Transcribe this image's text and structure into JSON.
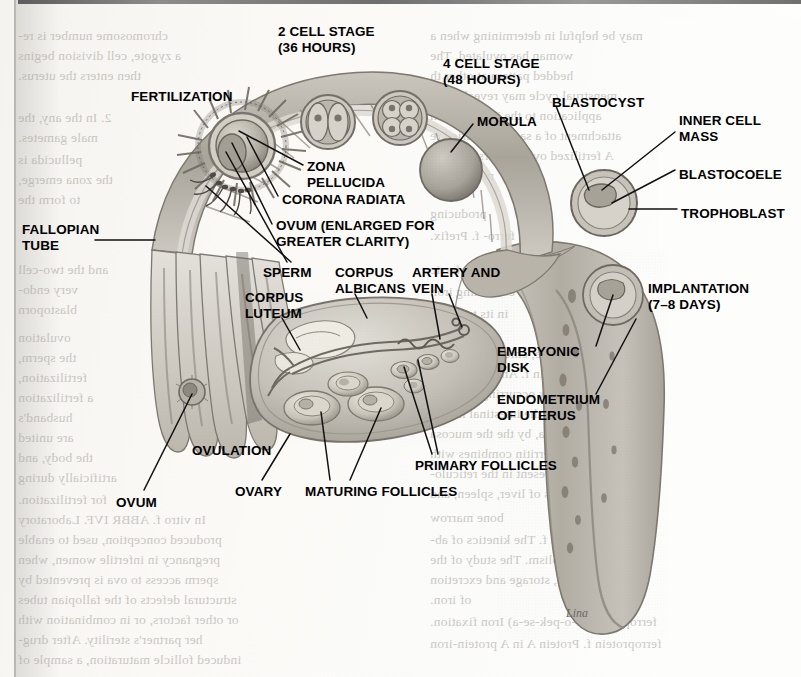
{
  "figure": {
    "signature": "Lina"
  },
  "palette": {
    "ink": "#000000",
    "paper": "#f8f7f4",
    "tissue_light": "#d9d6cf",
    "tissue_mid": "#b8b4ab",
    "tissue_dark": "#8e8a81",
    "tissue_deep": "#6e6a62",
    "ghost_text": "#9d9b95"
  },
  "labels": [
    {
      "id": "fertilization",
      "text": "FERTILIZATION",
      "x": 131,
      "y": 89,
      "align": "left"
    },
    {
      "id": "two-cell-stage",
      "text": "2 CELL STAGE\n(36 HOURS)",
      "x": 278,
      "y": 24,
      "align": "left"
    },
    {
      "id": "four-cell-stage",
      "text": "4 CELL STAGE\n(48 HOURS)",
      "x": 443,
      "y": 56,
      "align": "left"
    },
    {
      "id": "morula",
      "text": "MORULA",
      "x": 477,
      "y": 114,
      "align": "left"
    },
    {
      "id": "blastocyst",
      "text": "BLASTOCYST",
      "x": 552,
      "y": 95,
      "align": "left"
    },
    {
      "id": "inner-cell-mass",
      "text": "INNER CELL\nMASS",
      "x": 679,
      "y": 113,
      "align": "left"
    },
    {
      "id": "blastocoele",
      "text": "BLASTOCOELE",
      "x": 679,
      "y": 167,
      "align": "left"
    },
    {
      "id": "trophoblast",
      "text": "TROPHOBLAST",
      "x": 681,
      "y": 206,
      "align": "left"
    },
    {
      "id": "implantation",
      "text": "IMPLANTATION\n(7–8 DAYS)",
      "x": 648,
      "y": 281,
      "align": "left"
    },
    {
      "id": "zona-pellucida",
      "text": "ZONA\nPELLUCIDA",
      "x": 307,
      "y": 159,
      "align": "left"
    },
    {
      "id": "corona-radiata",
      "text": "CORONA RADIATA",
      "x": 282,
      "y": 192,
      "align": "left"
    },
    {
      "id": "ovum-enlarged",
      "text": "OVUM (ENLARGED FOR\nGREATER CLARITY)",
      "x": 276,
      "y": 218,
      "align": "left"
    },
    {
      "id": "sperm",
      "text": "SPERM",
      "x": 263,
      "y": 265,
      "align": "left"
    },
    {
      "id": "corpus-albicans",
      "text": "CORPUS\nALBICANS",
      "x": 335,
      "y": 265,
      "align": "left"
    },
    {
      "id": "artery-and-vein",
      "text": "ARTERY AND\nVEIN",
      "x": 412,
      "y": 265,
      "align": "left"
    },
    {
      "id": "corpus-luteum",
      "text": "CORPUS\nLUTEUM",
      "x": 245,
      "y": 290,
      "align": "left"
    },
    {
      "id": "fallopian-tube",
      "text": "FALLOPIAN\nTUBE",
      "x": 22,
      "y": 222,
      "align": "left"
    },
    {
      "id": "embryonic-disk",
      "text": "EMBRYONIC\nDISK",
      "x": 497,
      "y": 344,
      "align": "left"
    },
    {
      "id": "endometrium-of-uterus",
      "text": "ENDOMETRIUM\nOF UTERUS",
      "x": 497,
      "y": 392,
      "align": "left"
    },
    {
      "id": "primary-follicles",
      "text": "PRIMARY FOLLICLES",
      "x": 415,
      "y": 458,
      "align": "left"
    },
    {
      "id": "maturing-follicles",
      "text": "MATURING FOLLICLES",
      "x": 305,
      "y": 484,
      "align": "left"
    },
    {
      "id": "ovary",
      "text": "OVARY",
      "x": 235,
      "y": 484,
      "align": "left"
    },
    {
      "id": "ovulation",
      "text": "OVULATION",
      "x": 192,
      "y": 443,
      "align": "left"
    },
    {
      "id": "ovum",
      "text": "OVUM",
      "x": 116,
      "y": 495,
      "align": "left"
    }
  ],
  "leaders": [
    {
      "id": "fallopian-tube",
      "x1": 95,
      "y1": 240,
      "x2": 155,
      "y2": 240
    },
    {
      "id": "zona-pellucida",
      "x1": 303,
      "y1": 165,
      "x2": 239,
      "y2": 131
    },
    {
      "id": "corona-radiata",
      "x1": 278,
      "y1": 196,
      "x2": 247,
      "y2": 137
    },
    {
      "id": "ovum-enlarged",
      "x1": 272,
      "y1": 224,
      "x2": 232,
      "y2": 143
    },
    {
      "id": "sperm-a",
      "x1": 287,
      "y1": 262,
      "x2": 226,
      "y2": 152
    },
    {
      "id": "sperm-b",
      "x1": 291,
      "y1": 262,
      "x2": 206,
      "y2": 186
    },
    {
      "id": "corpus-luteum",
      "x1": 282,
      "y1": 318,
      "x2": 300,
      "y2": 350
    },
    {
      "id": "corpus-albicans",
      "x1": 355,
      "y1": 294,
      "x2": 367,
      "y2": 318
    },
    {
      "id": "artery-vein-a",
      "x1": 432,
      "y1": 294,
      "x2": 440,
      "y2": 339
    },
    {
      "id": "artery-vein-b",
      "x1": 449,
      "y1": 294,
      "x2": 462,
      "y2": 327
    },
    {
      "id": "morula",
      "x1": 473,
      "y1": 124,
      "x2": 451,
      "y2": 152
    },
    {
      "id": "blastocyst",
      "x1": 556,
      "y1": 106,
      "x2": 589,
      "y2": 190
    },
    {
      "id": "inner-cell-mass",
      "x1": 675,
      "y1": 132,
      "x2": 602,
      "y2": 190
    },
    {
      "id": "blastocoele",
      "x1": 675,
      "y1": 170,
      "x2": 612,
      "y2": 203
    },
    {
      "id": "trophoblast",
      "x1": 677,
      "y1": 209,
      "x2": 629,
      "y2": 209
    },
    {
      "id": "embryonic-disk",
      "x1": 596,
      "y1": 346,
      "x2": 613,
      "y2": 295
    },
    {
      "id": "endometrium",
      "x1": 596,
      "y1": 394,
      "x2": 636,
      "y2": 319
    },
    {
      "id": "primary-a",
      "x1": 432,
      "y1": 454,
      "x2": 404,
      "y2": 367
    },
    {
      "id": "primary-b",
      "x1": 438,
      "y1": 454,
      "x2": 418,
      "y2": 360
    },
    {
      "id": "maturing-a",
      "x1": 330,
      "y1": 480,
      "x2": 321,
      "y2": 412
    },
    {
      "id": "maturing-b",
      "x1": 350,
      "y1": 480,
      "x2": 381,
      "y2": 408
    },
    {
      "id": "ovary",
      "x1": 262,
      "y1": 480,
      "x2": 290,
      "y2": 434
    },
    {
      "id": "ovum",
      "x1": 144,
      "y1": 490,
      "x2": 192,
      "y2": 394
    }
  ],
  "ghost_text": {
    "left_column": [
      {
        "text": "chromosome number is re-",
        "x": 18,
        "y": 28
      },
      {
        "text": "a zygote, cell division begins",
        "x": 18,
        "y": 48
      },
      {
        "text": "then enters the uterus.",
        "x": 18,
        "y": 68
      },
      {
        "text": "2. In the any, the",
        "x": 18,
        "y": 110
      },
      {
        "text": "male gametes.",
        "x": 18,
        "y": 130
      },
      {
        "text": "pellucida is",
        "x": 18,
        "y": 152
      },
      {
        "text": "the zona emerge,",
        "x": 18,
        "y": 172
      },
      {
        "text": "to form the",
        "x": 18,
        "y": 192
      },
      {
        "text": "and the two-cell",
        "x": 18,
        "y": 262
      },
      {
        "text": "very endo-",
        "x": 18,
        "y": 282
      },
      {
        "text": "blastoporn",
        "x": 18,
        "y": 302
      },
      {
        "text": "ovulation",
        "x": 18,
        "y": 330
      },
      {
        "text": "the sperm,",
        "x": 18,
        "y": 350
      },
      {
        "text": "fertilization,",
        "x": 18,
        "y": 370
      },
      {
        "text": "a fertilization",
        "x": 18,
        "y": 390
      },
      {
        "text": "husband's",
        "x": 18,
        "y": 410
      },
      {
        "text": "are united",
        "x": 18,
        "y": 430
      },
      {
        "text": "the body, and",
        "x": 18,
        "y": 450
      },
      {
        "text": "artificially during",
        "x": 18,
        "y": 470
      },
      {
        "text": "for fertilization.",
        "x": 18,
        "y": 492
      },
      {
        "text": "In vitro f. ABBR IVF. Laboratory",
        "x": 18,
        "y": 512
      },
      {
        "text": "produced conception, used to enable",
        "x": 18,
        "y": 532
      },
      {
        "text": "pregnancy in infertile women, when",
        "x": 18,
        "y": 552
      },
      {
        "text": "sperm access to ova is prevented by",
        "x": 18,
        "y": 572
      },
      {
        "text": "structural defects of the fallopian tubes",
        "x": 18,
        "y": 592
      },
      {
        "text": "or other factors, or in combination with",
        "x": 18,
        "y": 612
      },
      {
        "text": "her partner's sterility. After drug-",
        "x": 18,
        "y": 632
      },
      {
        "text": "induced follicle maturation, a sample of",
        "x": 18,
        "y": 652
      }
    ],
    "right_column": [
      {
        "text": "may be helpful in determining when a",
        "x": 430,
        "y": 28
      },
      {
        "text": "woman has ovulated. The",
        "x": 430,
        "y": 48
      },
      {
        "text": "hedded pattern at other th",
        "x": 430,
        "y": 68
      },
      {
        "text": "menstrual cycle may reveal focus",
        "x": 430,
        "y": 88
      },
      {
        "text": "application to the implantation",
        "x": 430,
        "y": 108
      },
      {
        "text": "attachment of a sample of dried re",
        "x": 430,
        "y": 128
      },
      {
        "text": "A fertilized ovum enters the tube",
        "x": 430,
        "y": 148
      },
      {
        "text": "membranes",
        "x": 430,
        "y": 168
      },
      {
        "text": "producing",
        "x": 430,
        "y": 206
      },
      {
        "text": "ferri, ferro-  f. Prefix.",
        "x": 430,
        "y": 228
      },
      {
        "text": "ferric",
        "x": 430,
        "y": 262
      },
      {
        "text": "2. Ferriporphyrin, containing iron",
        "x": 430,
        "y": 284
      },
      {
        "text": "in its trivalent",
        "x": 430,
        "y": 306
      },
      {
        "text": "f. chloride",
        "x": 430,
        "y": 326
      },
      {
        "text": "tincture in medicine, chiefly astringent",
        "x": 430,
        "y": 346
      },
      {
        "text": "ferritin  f. An iron-storage",
        "x": 430,
        "y": 366
      },
      {
        "text": "protein complex occurring through-",
        "x": 430,
        "y": 386
      },
      {
        "text": "out; it is found in the intestinal muco-",
        "x": 430,
        "y": 406
      },
      {
        "text": "sa, by the the mucosa",
        "x": 430,
        "y": 426
      },
      {
        "text": "ferritin, apoferritin combines with",
        "x": 430,
        "y": 446
      },
      {
        "text": "and is normally present in the reticulo-",
        "x": 430,
        "y": 466
      },
      {
        "text": "endothelial cells of liver, spleen, and",
        "x": 430,
        "y": 486
      },
      {
        "text": "bone marrow",
        "x": 430,
        "y": 510
      },
      {
        "text": "ferrokinetics  f. The kinetics of ab- ",
        "x": 430,
        "y": 532
      },
      {
        "text": "sorption, metabolism. The study of the",
        "x": 430,
        "y": 552
      },
      {
        "text": "absorption, storage and excretion",
        "x": 430,
        "y": 572
      },
      {
        "text": "of iron.",
        "x": 430,
        "y": 592
      },
      {
        "text": "ferropexia  (fer-o-pek-se-a)  Iron fixation.",
        "x": 430,
        "y": 614
      },
      {
        "text": "ferroprotein  f. Protein A in A protein-iron",
        "x": 430,
        "y": 636
      }
    ]
  }
}
